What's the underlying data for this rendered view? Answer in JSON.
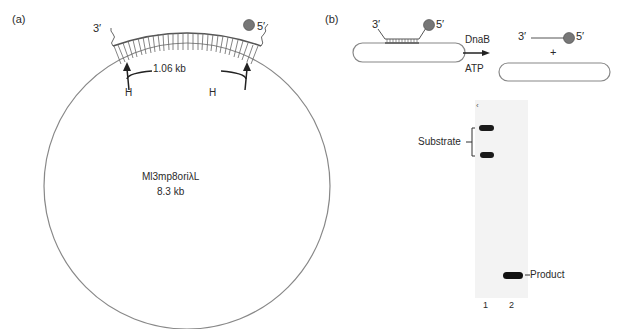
{
  "panel_a": {
    "label": "(a)",
    "end_3": "3′",
    "end_5": "5′",
    "span": "1.06 kb",
    "site_left": "H",
    "site_right": "H",
    "plasmid_name": "Ml3mp8oriλL",
    "plasmid_size": "8.3 kb"
  },
  "panel_b": {
    "label": "(b)",
    "end_3": "3′",
    "end_5": "5′",
    "enzyme": "DnaB",
    "cofactor": "ATP",
    "plus": "+",
    "product_3": "3′",
    "product_5": "5′",
    "gel": {
      "substrate_label": "Substrate",
      "product_label": "Product",
      "lanes": [
        "1",
        "2"
      ]
    }
  }
}
